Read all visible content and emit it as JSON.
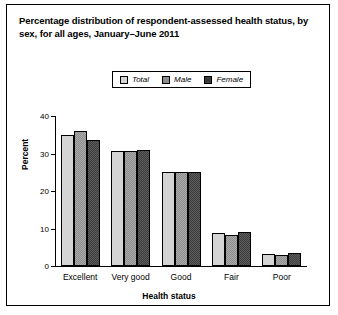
{
  "title": "Percentage distribution of respondent-assessed health status, by sex, for all ages, January–June 2011",
  "legend": {
    "items": [
      {
        "label": "Total",
        "color": "#d4d4d4",
        "icon": "legend-swatch"
      },
      {
        "label": "Male",
        "color": "#8d8d8d",
        "icon": "legend-swatch"
      },
      {
        "label": "Female",
        "color": "#3a3a3a",
        "icon": "legend-swatch"
      }
    ]
  },
  "chart_data": {
    "type": "bar",
    "title": "Percentage distribution of respondent-assessed health status, by sex, for all ages, January–June 2011",
    "xlabel": "Health status",
    "ylabel": "Percent",
    "categories": [
      "Excellent",
      "Very good",
      "Good",
      "Fair",
      "Poor"
    ],
    "series": [
      {
        "name": "Total",
        "color": "#d4d4d4",
        "values": [
          35.0,
          30.8,
          25.1,
          8.8,
          3.3
        ]
      },
      {
        "name": "Male",
        "color": "#8d8d8d",
        "values": [
          36.1,
          30.7,
          25.2,
          8.4,
          3.0
        ]
      },
      {
        "name": "Female",
        "color": "#3a3a3a",
        "values": [
          33.6,
          31.0,
          25.1,
          9.1,
          3.5
        ]
      }
    ],
    "ylim": [
      0,
      40
    ],
    "yticks": [
      0,
      10,
      20,
      30,
      40
    ],
    "ytick_labels": [
      "0",
      "10",
      "20",
      "30",
      "40"
    ],
    "grid": false,
    "legend_position": "top-center"
  }
}
